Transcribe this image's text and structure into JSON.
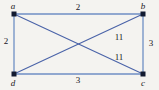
{
  "figure": {
    "kind": "weighted-graph-diagram",
    "width": 159,
    "height": 90,
    "background_color": "#f4f3f0"
  },
  "chart_data": {
    "type": "diagram",
    "title": "",
    "subtitle": "",
    "xlabel": "",
    "ylabel": "",
    "grid": false,
    "legend": "none",
    "graph_type": "undirected-weighted-graph",
    "nodes": [
      {
        "id": "a",
        "label": "a",
        "x": 14,
        "y": 14,
        "label_x": 13,
        "label_y": 6
      },
      {
        "id": "b",
        "label": "b",
        "x": 143,
        "y": 14,
        "label_x": 143,
        "label_y": 6
      },
      {
        "id": "c",
        "label": "c",
        "x": 143,
        "y": 74,
        "label_x": 143,
        "label_y": 83
      },
      {
        "id": "d",
        "label": "d",
        "x": 14,
        "y": 74,
        "label_x": 13,
        "label_y": 83
      }
    ],
    "edges": [
      {
        "from": "a",
        "to": "b",
        "weight": 2,
        "weight_label": "2",
        "label_x": 78,
        "label_y": 7,
        "kind": "side",
        "color": "#6f8fc4"
      },
      {
        "from": "a",
        "to": "d",
        "weight": 2,
        "weight_label": "2",
        "label_x": 6,
        "label_y": 41,
        "kind": "side",
        "color": "#6f8fc4"
      },
      {
        "from": "b",
        "to": "c",
        "weight": 3,
        "weight_label": "3",
        "label_x": 151,
        "label_y": 43,
        "kind": "side",
        "color": "#6f8fc4"
      },
      {
        "from": "d",
        "to": "c",
        "weight": 3,
        "weight_label": "3",
        "label_x": 78,
        "label_y": 80,
        "kind": "side",
        "color": "#6f8fc4"
      },
      {
        "from": "a",
        "to": "c",
        "weight": 11,
        "weight_label": "11",
        "label_x": 119,
        "label_y": 57,
        "kind": "diagonal",
        "color": "#4a63a8"
      },
      {
        "from": "b",
        "to": "d",
        "weight": 11,
        "weight_label": "11",
        "label_x": 119,
        "label_y": 37,
        "kind": "diagonal",
        "color": "#4a63a8"
      }
    ],
    "vertex_marker": {
      "shape": "square",
      "size": 5,
      "color": "#121a30"
    },
    "colors": {
      "side_edge": "#6f8fc4",
      "diagonal_edge": "#4a63a8",
      "vertex": "#121a30",
      "vertex_label": "#1a1a24",
      "weight_label": "#14141e",
      "background": "#f4f3f0"
    }
  }
}
